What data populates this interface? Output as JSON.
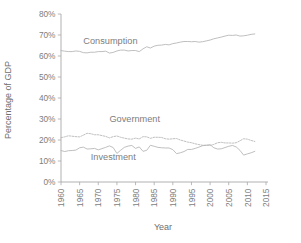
{
  "chart_data": {
    "type": "line",
    "title": "",
    "xlabel": "Year",
    "ylabel": "Percentage of GDP",
    "xlim": [
      1960,
      2015
    ],
    "ylim": [
      0,
      80
    ],
    "grid": false,
    "legend": "inline-labels",
    "x_tick_labels": [
      "1960",
      "1965",
      "1970",
      "1975",
      "1980",
      "1985",
      "1990",
      "1995",
      "2000",
      "2005",
      "2010",
      "2015"
    ],
    "x_ticks": [
      1960,
      1965,
      1970,
      1975,
      1980,
      1985,
      1990,
      1995,
      2000,
      2005,
      2010,
      2015
    ],
    "y_tick_labels": [
      "0%",
      "10%",
      "20%",
      "30%",
      "40%",
      "50%",
      "60%",
      "70%",
      "80%"
    ],
    "y_ticks": [
      0,
      10,
      20,
      30,
      40,
      50,
      60,
      70,
      80
    ],
    "x": [
      1960,
      1961,
      1962,
      1963,
      1964,
      1965,
      1966,
      1967,
      1968,
      1969,
      1970,
      1971,
      1972,
      1973,
      1974,
      1975,
      1976,
      1977,
      1978,
      1979,
      1980,
      1981,
      1982,
      1983,
      1984,
      1985,
      1986,
      1987,
      1988,
      1989,
      1990,
      1991,
      1992,
      1993,
      1994,
      1995,
      1996,
      1997,
      1998,
      1999,
      2000,
      2001,
      2002,
      2003,
      2004,
      2005,
      2006,
      2007,
      2008,
      2009,
      2010,
      2011,
      2012
    ],
    "series": [
      {
        "name": "Consumption",
        "style": "solid",
        "label_x": 1966,
        "label_y": 65.5,
        "values": [
          62.6,
          62.3,
          62.1,
          62.1,
          62.4,
          62.2,
          61.6,
          61.5,
          61.8,
          61.8,
          62.1,
          62.1,
          62.3,
          61.4,
          61.7,
          62.4,
          62.8,
          62.8,
          62.4,
          62.6,
          62.6,
          62.1,
          63.4,
          64.4,
          63.8,
          64.7,
          65.1,
          65.2,
          65.5,
          65.3,
          65.9,
          66.2,
          66.6,
          66.9,
          66.9,
          66.8,
          66.9,
          66.6,
          66.8,
          67.2,
          67.6,
          68.2,
          68.6,
          69.0,
          69.5,
          69.9,
          69.8,
          70.0,
          69.5,
          69.6,
          69.9,
          70.3,
          70.5
        ]
      },
      {
        "name": "Government",
        "style": "dashed",
        "label_x": 1973,
        "label_y": 28.5,
        "values": [
          21.1,
          21.5,
          22.0,
          21.8,
          21.6,
          21.5,
          22.3,
          23.2,
          23.0,
          22.5,
          22.5,
          22.1,
          21.7,
          21.0,
          21.6,
          21.9,
          21.3,
          20.9,
          20.5,
          20.4,
          20.9,
          20.5,
          21.6,
          21.5,
          20.8,
          21.3,
          21.3,
          21.2,
          20.6,
          20.4,
          20.6,
          20.7,
          20.0,
          19.5,
          19.0,
          18.7,
          18.2,
          17.8,
          17.5,
          17.5,
          17.4,
          17.9,
          18.7,
          18.9,
          18.6,
          18.6,
          18.5,
          18.7,
          19.6,
          20.6,
          20.4,
          19.8,
          19.3
        ]
      },
      {
        "name": "Investment",
        "style": "solid",
        "label_x": 1968,
        "label_y": 10.5,
        "values": [
          15.0,
          14.5,
          14.9,
          15.0,
          15.2,
          16.3,
          16.6,
          15.7,
          15.8,
          16.0,
          15.3,
          15.9,
          16.5,
          17.2,
          16.4,
          13.6,
          15.1,
          16.5,
          17.1,
          17.4,
          16.0,
          16.7,
          14.6,
          15.1,
          17.5,
          17.0,
          16.5,
          16.3,
          16.2,
          16.2,
          15.4,
          13.5,
          13.9,
          14.5,
          15.5,
          15.5,
          16.0,
          16.6,
          17.3,
          17.5,
          17.8,
          16.3,
          15.7,
          15.8,
          16.4,
          17.0,
          17.4,
          16.7,
          15.1,
          12.8,
          13.4,
          13.9,
          14.6
        ]
      }
    ]
  }
}
